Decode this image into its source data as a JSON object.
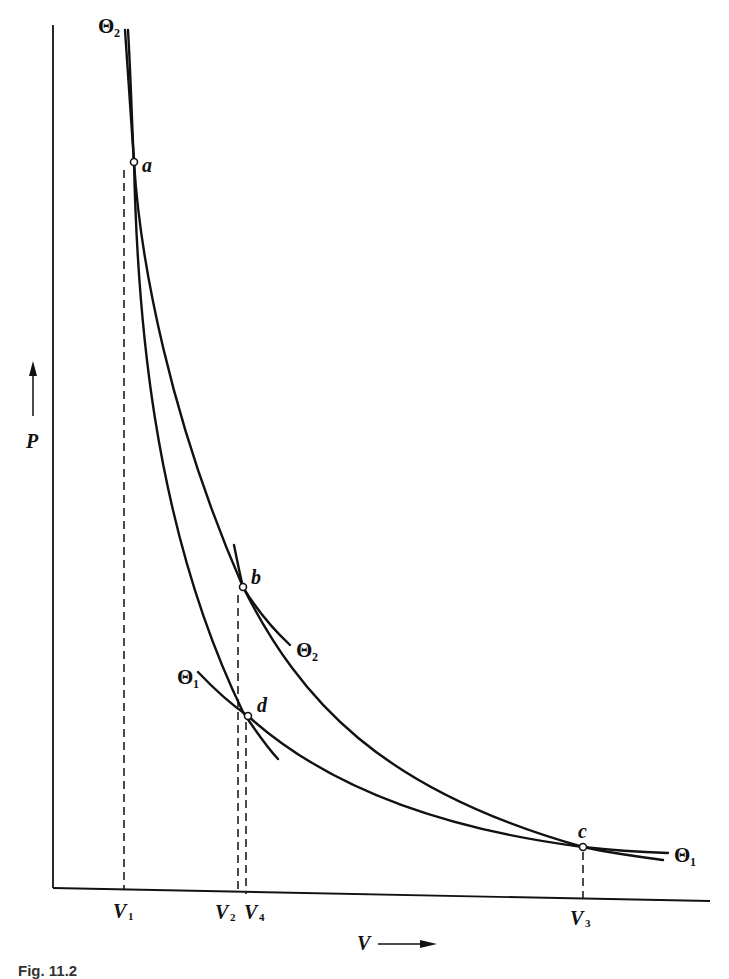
{
  "figure": {
    "type": "Carnot cycle P-V diagram",
    "axes": {
      "y_label": "P",
      "x_label": "V",
      "y_arrow": "up-arrow",
      "x_arrow": "right-arrow"
    },
    "points": [
      {
        "id": "a",
        "label": "a"
      },
      {
        "id": "b",
        "label": "b"
      },
      {
        "id": "c",
        "label": "c"
      },
      {
        "id": "d",
        "label": "d"
      }
    ],
    "curve_labels": {
      "theta2_top": {
        "symbol": "Θ",
        "sub": "2"
      },
      "theta2_mid": {
        "symbol": "Θ",
        "sub": "2"
      },
      "theta1_left": {
        "symbol": "Θ",
        "sub": "1"
      },
      "theta1_right": {
        "symbol": "Θ",
        "sub": "1"
      }
    },
    "volume_ticks": [
      {
        "label": "V",
        "sub": "1"
      },
      {
        "label": "V",
        "sub": "2"
      },
      {
        "label": "V",
        "sub": "4"
      },
      {
        "label": "V",
        "sub": "3"
      }
    ],
    "caption": "Fig. 11.2"
  }
}
